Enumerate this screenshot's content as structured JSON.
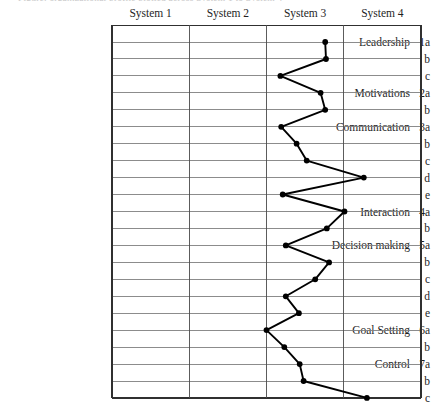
{
  "caption_clipped": "Figure: organizational profile plotted across System 1 to System 4",
  "columns": [
    {
      "label": "System 1"
    },
    {
      "label": "System 2"
    },
    {
      "label": "System 3"
    },
    {
      "label": "System 4"
    }
  ],
  "rows": [
    {
      "name": "Leadership",
      "code": "1a"
    },
    {
      "name": "",
      "code": "b"
    },
    {
      "name": "",
      "code": "c"
    },
    {
      "name": "Motivations",
      "code": "2a"
    },
    {
      "name": "",
      "code": "b"
    },
    {
      "name": "Communication",
      "code": "3a"
    },
    {
      "name": "",
      "code": "b"
    },
    {
      "name": "",
      "code": "c"
    },
    {
      "name": "",
      "code": "d"
    },
    {
      "name": "",
      "code": "e"
    },
    {
      "name": "Interaction",
      "code": "4a"
    },
    {
      "name": "",
      "code": "b"
    },
    {
      "name": "Decision making",
      "code": "5a"
    },
    {
      "name": "",
      "code": "b"
    },
    {
      "name": "",
      "code": "c"
    },
    {
      "name": "",
      "code": "d"
    },
    {
      "name": "",
      "code": "e"
    },
    {
      "name": "Goal Setting",
      "code": "6a"
    },
    {
      "name": "",
      "code": "b"
    },
    {
      "name": "Control",
      "code": "7a"
    },
    {
      "name": "",
      "code": "b"
    },
    {
      "name": "",
      "code": "c"
    }
  ],
  "chart_data": {
    "type": "line",
    "title": "",
    "xlabel": "",
    "ylabel": "",
    "orientation": "vertical-categories",
    "grid": true,
    "legend": "none",
    "xlim": [
      1,
      4
    ],
    "x_tick_labels": [
      "System 1",
      "System 2",
      "System 3",
      "System 4"
    ],
    "x_tick_values": [
      1,
      2,
      3,
      4
    ],
    "categories": [
      "1a",
      "1b",
      "1c",
      "2a",
      "2b",
      "3a",
      "3b",
      "3c",
      "3d",
      "3e",
      "4a",
      "4b",
      "5a",
      "5b",
      "5c",
      "5d",
      "5e",
      "6a",
      "6b",
      "7a",
      "7b",
      "7c"
    ],
    "category_labels": [
      "Leadership 1a",
      "b",
      "c",
      "Motivations 2a",
      "b",
      "Communication 3a",
      "b",
      "c",
      "d",
      "e",
      "Interaction 4a",
      "b",
      "Decision making 5a",
      "b",
      "c",
      "d",
      "e",
      "Goal Setting 6a",
      "b",
      "Control 7a",
      "b",
      "c"
    ],
    "values": [
      3.76,
      3.77,
      3.18,
      3.7,
      3.76,
      3.19,
      3.39,
      3.52,
      4.26,
      3.21,
      4.01,
      3.78,
      3.25,
      3.81,
      3.63,
      3.25,
      3.42,
      3.0,
      3.23,
      3.43,
      3.48,
      4.3
    ],
    "marker": "filled-circle",
    "marker_color": "#000000",
    "line_color": "#000000"
  },
  "colors": {
    "grid_line": "#808080",
    "border_line": "#303030",
    "text": "#1f1f1f",
    "plot_line": "#000000"
  }
}
